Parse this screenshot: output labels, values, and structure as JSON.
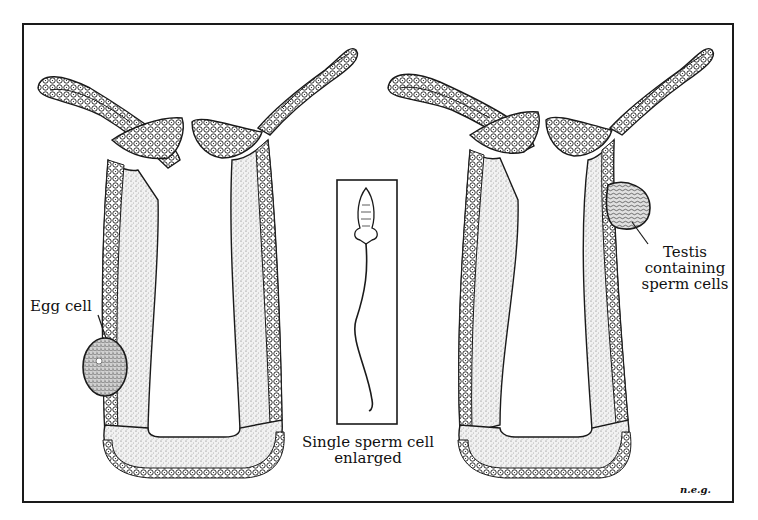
{
  "figure": {
    "panels": [
      {
        "id": "left-hydra",
        "label": "Egg cell"
      },
      {
        "id": "sperm-inset",
        "label_line1": "Single sperm cell",
        "label_line2": "enlarged"
      },
      {
        "id": "right-hydra",
        "label_line1": "Testis",
        "label_line2": "containing",
        "label_line3": "sperm cells"
      }
    ],
    "signature": "n.e.g."
  },
  "colors": {
    "ink": "#1a1a1a",
    "paper": "#ffffff",
    "stipple": "#8a8a8a"
  }
}
